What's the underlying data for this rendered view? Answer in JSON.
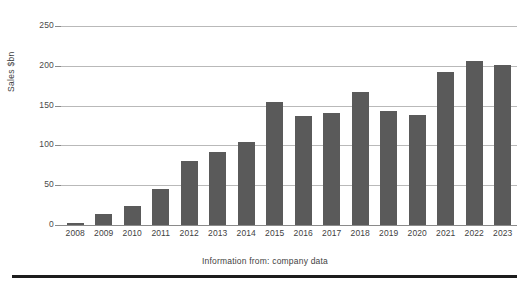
{
  "chart_data": {
    "type": "bar",
    "title": "",
    "subtitle": "",
    "xlabel": "",
    "ylabel": "Sales $bn",
    "categories": [
      "2008",
      "2009",
      "2010",
      "2011",
      "2012",
      "2013",
      "2014",
      "2015",
      "2016",
      "2017",
      "2018",
      "2019",
      "2020",
      "2021",
      "2022",
      "2023"
    ],
    "values": [
      2,
      14,
      24,
      45,
      80,
      92,
      104,
      155,
      137,
      141,
      167,
      143,
      138,
      192,
      206,
      201
    ],
    "series": [
      {
        "name": "Sales",
        "values": [
          2,
          14,
          24,
          45,
          80,
          92,
          104,
          155,
          137,
          141,
          167,
          143,
          138,
          192,
          206,
          201
        ]
      }
    ],
    "ylim": [
      0,
      260
    ],
    "yticks": [
      0,
      50,
      100,
      150,
      200,
      250
    ],
    "ytick_labels": [
      "0",
      "50",
      "100",
      "150",
      "200",
      "250"
    ],
    "grid": true,
    "legend": false,
    "legend_position": "none",
    "bar_color": "#5a5a5a",
    "gridline_color": "#b9b9b9",
    "annotations": []
  },
  "footer": {
    "source_note": "Information from:  company data"
  },
  "axes": {
    "y_axis_title": "Sales $bn"
  }
}
